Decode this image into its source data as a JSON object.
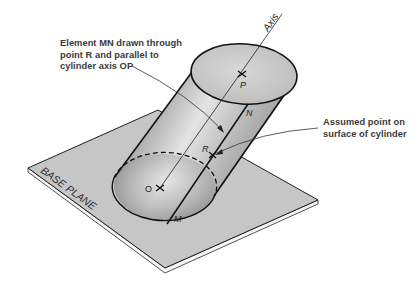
{
  "figure": {
    "callouts": {
      "element_mn": "Element MN drawn through\npoint R and parallel to\ncylinder axis OP",
      "assumed_point": "Assumed point on\nsurface of cylinder"
    },
    "labels": {
      "axis": "Axis",
      "base_plane": "BASE PLANE",
      "point_p": "P",
      "point_o": "O",
      "point_r": "R",
      "point_m": "M",
      "point_n": "N"
    },
    "colors": {
      "plane_fill": "#c4c4c4",
      "plane_edge": "#f4f4f4",
      "cylinder_dark": "#6e6e6e",
      "cylinder_light": "#e2e2e2",
      "top_face": "#cfcfcf",
      "line": "#1a1a1a",
      "text": "#3a3a3a"
    }
  }
}
